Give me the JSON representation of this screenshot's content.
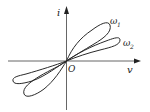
{
  "diagram": {
    "type": "pinched hysteresis i-v characteristic",
    "axes": {
      "x_label": "v",
      "y_label": "i",
      "origin_label": "O"
    },
    "curves": [
      {
        "name": "omega1",
        "label": "ω",
        "subscript": "1",
        "description": "steeper, wider loop"
      },
      {
        "name": "omega2",
        "label": "ω",
        "subscript": "2",
        "description": "flatter, narrower loop"
      }
    ],
    "colors": {
      "stroke": "#2a2a2a",
      "background": "#ffffff"
    }
  }
}
